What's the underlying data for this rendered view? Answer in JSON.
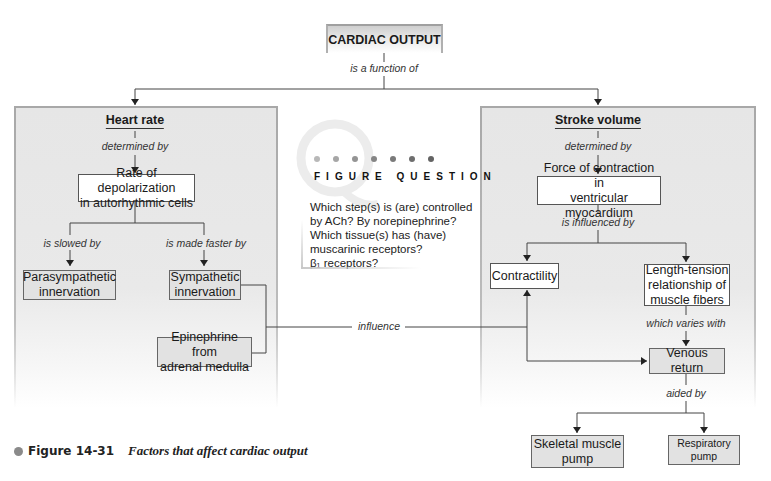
{
  "diagram": {
    "root": {
      "label": "CARDIAC OUTPUT",
      "relation": "is a function of"
    },
    "left_panel": {
      "heading": "Heart rate",
      "relation_1": "determined by",
      "node_rate": "Rate of depolarization in autorhythmic cells",
      "node_rate_lines": [
        "Rate of depolarization",
        "in autorhythmic cells"
      ],
      "relation_slowed": "is slowed by",
      "relation_faster": "is made faster by",
      "node_parasympathetic_lines": [
        "Parasympathetic",
        "innervation"
      ],
      "node_sympathetic_lines": [
        "Sympathetic",
        "innervation"
      ],
      "node_epinephrine_lines": [
        "Epinephrine from",
        "adrenal medulla"
      ]
    },
    "cross_link": {
      "label": "influence"
    },
    "right_panel": {
      "heading": "Stroke volume",
      "relation_1": "determined by",
      "node_force_lines": [
        "Force of contraction in",
        "ventricular myocardium"
      ],
      "relation_2": "is influenced by",
      "node_contractility": "Contractility",
      "node_length_tension_lines": [
        "Length-tension",
        "relationship of",
        "muscle fibers"
      ],
      "relation_3": "which varies with",
      "node_venous_return": "Venous return",
      "relation_4": "aided by",
      "node_skeletal_lines": [
        "Skeletal muscle",
        "pump"
      ],
      "node_respiratory_lines": [
        "Respiratory",
        "pump"
      ]
    }
  },
  "figure_question": {
    "title": "FIGURE QUESTION",
    "watermark_letter": "Q",
    "dot_colors": [
      "#b8b8b8",
      "#a6a6a6",
      "#949494",
      "#858585",
      "#7a7a7a",
      "#6e6e6e",
      "#636363"
    ],
    "lines": [
      "Which step(s) is (are) controlled",
      "by ACh? By norepinephrine?",
      "Which tissue(s) has (have)",
      "muscarinic receptors?",
      "β₁ receptors?"
    ]
  },
  "caption": {
    "number": "Figure 14-31",
    "title": "Factors that affect cardiac output"
  },
  "colors": {
    "panel_fill": "#e6e6e6",
    "panel_border": "#a8a8a8",
    "grey_box": "#e2e2e2",
    "line": "#444444"
  }
}
